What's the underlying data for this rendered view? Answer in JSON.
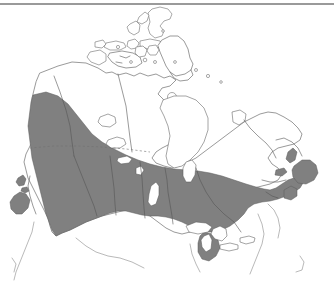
{
  "figure": {
    "kind": "thematic-range-map",
    "title": "",
    "caption": "",
    "background_color": "#ffffff"
  },
  "top_rule": {
    "present": true,
    "color": "#9a9a9a"
  },
  "legend": {
    "present": false,
    "entries": []
  },
  "map": {
    "projection_hint": "conic",
    "outline_color": "#6e6e6e",
    "border_color": "#555555",
    "shaded_region": {
      "name": "shaded-range-band",
      "fill_color": "#808080",
      "description": "continuous band across southern Canada",
      "coverage_regions": [
        "Pacific Coast",
        "British Columbia",
        "Alberta",
        "Saskatchewan",
        "Manitoba",
        "Southern Ontario",
        "Southern Quebec",
        "Maritimes",
        "Newfoundland"
      ]
    },
    "reference_lines": [
      {
        "name": "sixtieth-parallel",
        "style": "dashed",
        "color": "#707070"
      }
    ],
    "water_bodies": [
      "Hudson Bay",
      "Great Lakes",
      "Great Bear Lake",
      "Great Slave Lake",
      "Lake Winnipeg",
      "Lake Athabasca"
    ],
    "island_groups": [
      "Arctic Archipelago",
      "Baffin Island",
      "Victoria Island",
      "Banks Island",
      "Ellesmere Island",
      "Vancouver Island",
      "Haida Gwaii",
      "Newfoundland",
      "Prince Edward Island",
      "Anticosti Island"
    ]
  },
  "labels": {
    "place_labels": [],
    "axis_labels": [],
    "annotations": []
  }
}
